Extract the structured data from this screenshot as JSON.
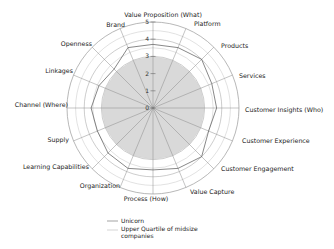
{
  "chart_data": {
    "type": "radar",
    "title": "",
    "categories": [
      "Value Proposition (What)",
      "Platform",
      "Products",
      "Services",
      "Customer Insights (Who)",
      "Customer Experience",
      "Customer Engagement",
      "Value Capture",
      "Process (How)",
      "Organization",
      "Learning Capabilities",
      "Supply",
      "Channel (Where)",
      "Linkages",
      "Openness",
      "Brand"
    ],
    "series": [
      {
        "name": "Unicorn",
        "style": "line",
        "color": "#555555",
        "values": [
          3.7,
          3.8,
          4.0,
          3.7,
          3.7,
          3.5,
          4.0,
          3.8,
          3.6,
          3.8,
          3.7,
          3.5,
          3.6,
          3.4,
          3.2,
          3.8
        ]
      },
      {
        "name": "Upper Quartile of midsize companies",
        "style": "filled",
        "color": "#d9d9d9",
        "values": [
          3.0,
          3.0,
          3.0,
          3.0,
          3.0,
          3.0,
          3.0,
          3.0,
          3.0,
          3.0,
          3.0,
          3.0,
          3.0,
          3.0,
          3.0,
          3.0
        ]
      }
    ],
    "radial_ticks": [
      "0",
      "1",
      "2",
      "3",
      "4",
      "5"
    ],
    "rlim": [
      0,
      5
    ],
    "grid": true,
    "legend_position": "bottom-left"
  },
  "legend": {
    "unicorn": "Unicorn",
    "upper_quartile_line1": "Upper Quartile of midsize",
    "upper_quartile_line2": "companies"
  }
}
